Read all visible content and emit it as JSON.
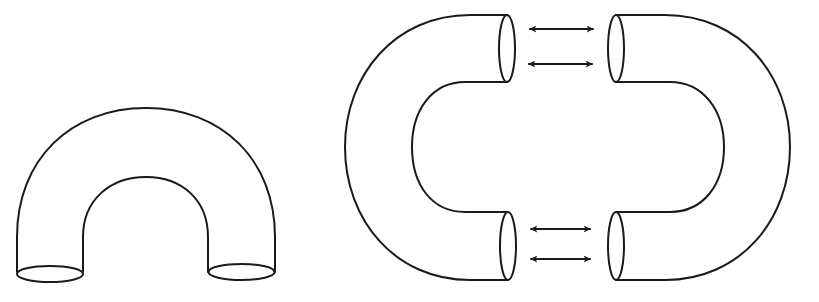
{
  "diagram": {
    "background": "#ffffff",
    "stroke_color": "#1a1a1a",
    "figures": [
      {
        "id": "u-tube",
        "description": "Bent tube (U shape) with two elliptical open ends at the bottom"
      },
      {
        "id": "left-half-tube",
        "description": "C-shaped curved tube half with two open ends facing right"
      },
      {
        "id": "right-half-tube",
        "description": "Mirror C-shaped curved tube half with two open ends facing left"
      }
    ],
    "arrows": [
      {
        "id": "arrow-top-1",
        "type": "double-headed"
      },
      {
        "id": "arrow-top-2",
        "type": "double-headed"
      },
      {
        "id": "arrow-bottom-1",
        "type": "double-headed"
      },
      {
        "id": "arrow-bottom-2",
        "type": "double-headed"
      }
    ]
  }
}
